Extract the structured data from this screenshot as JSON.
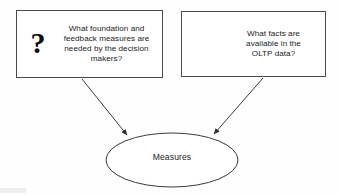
{
  "diagram": {
    "background_color": "#fefefe",
    "border_color": "#4a4a4a",
    "arrow_color": "#3c3c3c",
    "text_color": "#1b1b1b",
    "icon_color": "#0a0a0a"
  },
  "nodes": {
    "question_box": {
      "icon": "question-mark-icon",
      "icon_glyph": "?",
      "lines": [
        "What foundation and",
        "feedback measures are",
        "needed by the decision",
        "makers?"
      ],
      "full_text": "What foundation and feedback measures are needed by the decision makers?"
    },
    "database_box": {
      "icon": "database-cylinder-icon",
      "lines": [
        "What facts are",
        "available in the",
        "OLTP data?"
      ],
      "full_text": "What facts are available in the OLTP data?"
    },
    "measures_ellipse": {
      "label": "Measures"
    }
  },
  "edges": [
    {
      "name": "arrow-question-to-measures",
      "from": "question_box",
      "to": "measures_ellipse",
      "arrowhead": "solid-triangle"
    },
    {
      "name": "arrow-database-to-measures",
      "from": "database_box",
      "to": "measures_ellipse",
      "arrowhead": "solid-triangle"
    }
  ]
}
